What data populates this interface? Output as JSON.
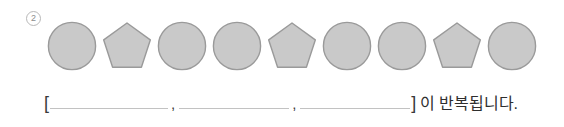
{
  "item": {
    "marker_label": "2",
    "marker_style": "circled-number"
  },
  "sequence": {
    "name": "shape-pattern-sequence",
    "shapes": [
      {
        "kind": "circle",
        "label": "원"
      },
      {
        "kind": "pentagon",
        "label": "오각형"
      },
      {
        "kind": "circle",
        "label": "원"
      },
      {
        "kind": "circle",
        "label": "원"
      },
      {
        "kind": "pentagon",
        "label": "오각형"
      },
      {
        "kind": "circle",
        "label": "원"
      },
      {
        "kind": "circle",
        "label": "원"
      },
      {
        "kind": "pentagon",
        "label": "오각형"
      },
      {
        "kind": "circle",
        "label": "원"
      }
    ],
    "fill_color": "#c9c9c9",
    "stroke_color": "#9a9a9a"
  },
  "answer": {
    "open_bracket": "[",
    "close_bracket": "]",
    "separator": ",",
    "blank_1_value": "",
    "blank_2_value": "",
    "blank_3_value": "",
    "trailing_text": "이 반복됩니다."
  }
}
